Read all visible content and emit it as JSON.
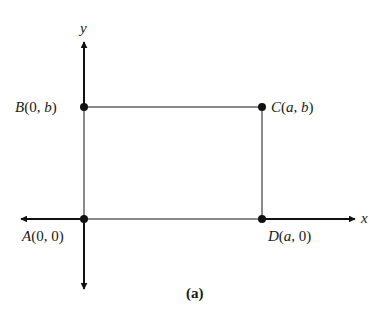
{
  "figure": {
    "caption": "(a)",
    "axes": {
      "x_label": "x",
      "y_label": "y"
    },
    "points": [
      {
        "id": "A",
        "name": "A",
        "coords": "(0, 0)",
        "x": "0",
        "y": "0"
      },
      {
        "id": "B",
        "name": "B",
        "coords": "(0, b)",
        "x": "0",
        "y": "b"
      },
      {
        "id": "C",
        "name": "C",
        "coords": "(a, b)",
        "x": "a",
        "y": "b"
      },
      {
        "id": "D",
        "name": "D",
        "coords": "(a, 0)",
        "x": "a",
        "y": "0"
      }
    ],
    "shape": "rectangle ABCD",
    "colors": {
      "axis": "#111111",
      "rectangle": "#8a8a8a",
      "point": "#111111"
    }
  }
}
